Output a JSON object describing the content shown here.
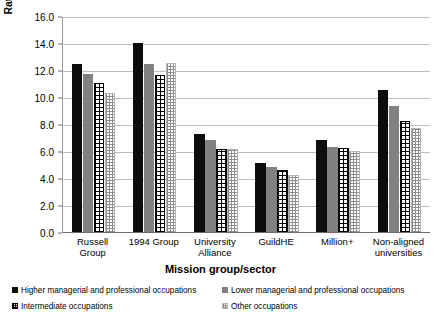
{
  "chart_data": {
    "type": "bar",
    "title": "",
    "xlabel": "Mission group/sector",
    "ylabel": "Rate of progression",
    "ylim": [
      0.0,
      16.0
    ],
    "ytick_step": 2.0,
    "ytick_labels": [
      "16.0",
      "14.0",
      "12.0",
      "10.0",
      "8.0",
      "6.0",
      "4.0",
      "2.0",
      "0.0"
    ],
    "grid": "horizontal",
    "legend_position": "bottom",
    "categories": [
      "Russell Group",
      "1994 Group",
      "University Alliance",
      "GuildHE",
      "Million+",
      "Non-aligned universities"
    ],
    "category_lines": [
      [
        "Russell",
        "Group"
      ],
      [
        "1994 Group"
      ],
      [
        "University",
        "Alliance"
      ],
      [
        "GuildHE"
      ],
      [
        "Million+"
      ],
      [
        "Non-aligned",
        "universities"
      ]
    ],
    "series": [
      {
        "name": "Higher managerial and professional occupations",
        "pattern": "solid-black",
        "color": "#0d0d0d",
        "values": [
          12.5,
          14.1,
          7.3,
          5.2,
          6.9,
          10.6
        ]
      },
      {
        "name": "Lower managerial and professional occupations",
        "pattern": "solid-grey",
        "color": "#818181",
        "values": [
          11.8,
          12.5,
          6.9,
          4.9,
          6.4,
          9.4
        ]
      },
      {
        "name": "Intermediate occupations",
        "pattern": "black-crosshatch",
        "color": "#000000",
        "values": [
          11.1,
          11.7,
          6.2,
          4.7,
          6.3,
          8.3
        ]
      },
      {
        "name": "Other occupations",
        "pattern": "light-stipple",
        "color": "#b4b4b4",
        "values": [
          10.4,
          12.6,
          6.2,
          4.3,
          6.1,
          7.8
        ]
      }
    ]
  }
}
